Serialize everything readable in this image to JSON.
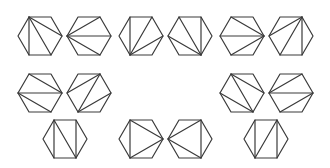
{
  "figure": {
    "title": "",
    "stroke_color": "#3a3a3a",
    "background": "#ffffff",
    "hexagon": {
      "half_width": 22,
      "half_height": 19,
      "vertex_order": [
        "left",
        "top-left",
        "top-right",
        "right",
        "bottom-right",
        "bottom-left"
      ]
    },
    "hexagons": [
      {
        "id": 1,
        "cx": 40,
        "cy": 36,
        "diagonals": [
          [
            1,
            3
          ],
          [
            1,
            4
          ],
          [
            1,
            5
          ]
        ]
      },
      {
        "id": 2,
        "cx": 89,
        "cy": 36,
        "diagonals": [
          [
            0,
            2
          ],
          [
            0,
            3
          ],
          [
            0,
            4
          ]
        ]
      },
      {
        "id": 3,
        "cx": 141,
        "cy": 36,
        "diagonals": [
          [
            5,
            1
          ],
          [
            5,
            2
          ],
          [
            5,
            3
          ]
        ]
      },
      {
        "id": 4,
        "cx": 190,
        "cy": 36,
        "diagonals": [
          [
            4,
            0
          ],
          [
            4,
            1
          ],
          [
            4,
            2
          ]
        ]
      },
      {
        "id": 5,
        "cx": 242,
        "cy": 36,
        "diagonals": [
          [
            3,
            1
          ],
          [
            3,
            0
          ],
          [
            3,
            5
          ]
        ]
      },
      {
        "id": 6,
        "cx": 291,
        "cy": 36,
        "diagonals": [
          [
            2,
            0
          ],
          [
            2,
            5
          ],
          [
            2,
            4
          ]
        ]
      },
      {
        "id": 7,
        "cx": 40,
        "cy": 93,
        "diagonals": [
          [
            1,
            3
          ],
          [
            0,
            3
          ],
          [
            0,
            4
          ]
        ]
      },
      {
        "id": 8,
        "cx": 89,
        "cy": 93,
        "diagonals": [
          [
            0,
            2
          ],
          [
            2,
            5
          ],
          [
            5,
            3
          ]
        ]
      },
      {
        "id": 9,
        "cx": 242,
        "cy": 93,
        "diagonals": [
          [
            1,
            3
          ],
          [
            1,
            4
          ],
          [
            0,
            4
          ]
        ]
      },
      {
        "id": 10,
        "cx": 291,
        "cy": 93,
        "diagonals": [
          [
            0,
            2
          ],
          [
            0,
            3
          ],
          [
            3,
            5
          ]
        ]
      },
      {
        "id": 11,
        "cx": 65,
        "cy": 139,
        "diagonals": [
          [
            1,
            5
          ],
          [
            1,
            4
          ],
          [
            2,
            4
          ]
        ]
      },
      {
        "id": 12,
        "cx": 141,
        "cy": 139,
        "diagonals": [
          [
            1,
            3
          ],
          [
            3,
            5
          ],
          [
            1,
            5
          ]
        ]
      },
      {
        "id": 13,
        "cx": 190,
        "cy": 139,
        "diagonals": [
          [
            0,
            2
          ],
          [
            2,
            4
          ],
          [
            0,
            4
          ]
        ]
      },
      {
        "id": 14,
        "cx": 266,
        "cy": 139,
        "diagonals": [
          [
            1,
            5
          ],
          [
            2,
            5
          ],
          [
            2,
            4
          ]
        ]
      }
    ]
  }
}
